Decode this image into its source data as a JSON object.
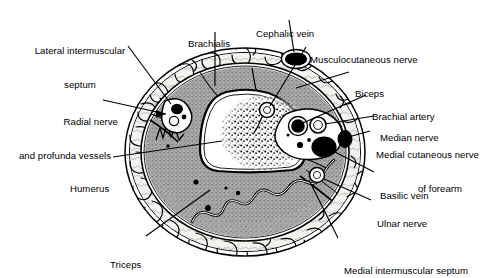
{
  "figure": {
    "background_color": "#ffffff",
    "line_color": "#000000",
    "muscle_fill": "#a8a8a8",
    "fat_fill": "#f2f0ec",
    "bone_fill": "#ffffff",
    "vessel_dark": "#000000"
  },
  "labels": [
    {
      "id": "lateral-intermuscular-septum",
      "line1": "Lateral intermuscular",
      "line2": "septum",
      "align": "center",
      "x": 62,
      "y": 23
    },
    {
      "id": "brachialis",
      "line1": "Brachialis",
      "line2": "",
      "align": "left",
      "x": 188,
      "y": 16
    },
    {
      "id": "cephalic-vein",
      "line1": "Cephalic vein",
      "line2": "",
      "align": "left",
      "x": 256,
      "y": 6
    },
    {
      "id": "musculocutaneous-nerve",
      "line1": "Musculocutaneous nerve",
      "line2": "",
      "align": "left",
      "x": 310,
      "y": 32
    },
    {
      "id": "biceps",
      "line1": "Biceps",
      "line2": "",
      "align": "left",
      "x": 355,
      "y": 66
    },
    {
      "id": "brachial-artery",
      "line1": "Brachial artery",
      "line2": "",
      "align": "left",
      "x": 372,
      "y": 89
    },
    {
      "id": "median-nerve",
      "line1": "Median nerve",
      "line2": "",
      "align": "left",
      "x": 380,
      "y": 110
    },
    {
      "id": "medial-cutaneous-nerve-of-forearm",
      "line1": "Medial cutaneous nerve",
      "line2": "of forearm",
      "align": "left",
      "x": 376,
      "y": 127
    },
    {
      "id": "basilic-vein",
      "line1": "Basilic vein",
      "line2": "",
      "align": "left",
      "x": 380,
      "y": 168
    },
    {
      "id": "ulnar-nerve",
      "line1": "Ulnar nerve",
      "line2": "",
      "align": "left",
      "x": 377,
      "y": 196
    },
    {
      "id": "medial-intermuscular-septum",
      "line1": "Medial intermuscular septum",
      "line2": "",
      "align": "left",
      "x": 344,
      "y": 243
    },
    {
      "id": "radial-nerve-and-profunda-vessels",
      "line1": "Radial nerve",
      "line2": "and profunda vessels",
      "align": "center",
      "x": 12,
      "y": 94
    },
    {
      "id": "humerus",
      "line1": "Humerus",
      "line2": "",
      "align": "left",
      "x": 70,
      "y": 161
    },
    {
      "id": "triceps",
      "line1": "Triceps",
      "line2": "",
      "align": "left",
      "x": 110,
      "y": 237
    }
  ],
  "structures": [
    {
      "id": "skin-outline",
      "kind": "outline"
    },
    {
      "id": "subcutaneous-fat",
      "kind": "tissue"
    },
    {
      "id": "deep-fascia",
      "kind": "outline"
    },
    {
      "id": "humerus-bone",
      "kind": "bone"
    },
    {
      "id": "bone-marrow",
      "kind": "marrow"
    },
    {
      "id": "anterior-compartment-muscle",
      "kind": "muscle"
    },
    {
      "id": "posterior-compartment-muscle",
      "kind": "muscle"
    },
    {
      "id": "cephalic-vein-vessel",
      "kind": "vein"
    },
    {
      "id": "basilic-vein-vessel",
      "kind": "vein"
    },
    {
      "id": "brachial-artery-vessel",
      "kind": "artery"
    },
    {
      "id": "median-nerve-bundle",
      "kind": "nerve"
    },
    {
      "id": "ulnar-nerve-bundle",
      "kind": "nerve"
    },
    {
      "id": "radial-nerve-bundle",
      "kind": "nerve"
    },
    {
      "id": "musculocutaneous-nerve-bundle",
      "kind": "nerve"
    },
    {
      "id": "medial-cutaneous-nerve-bundle",
      "kind": "nerve"
    },
    {
      "id": "lateral-septum-band",
      "kind": "septum"
    },
    {
      "id": "medial-septum-band",
      "kind": "septum"
    }
  ]
}
